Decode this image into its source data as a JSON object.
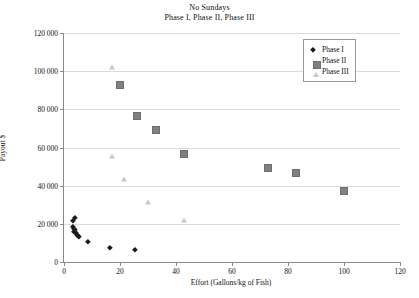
{
  "chart_data": {
    "type": "scatter",
    "title": "No Sundays",
    "subtitle": "Phase I, Phase II, Phase III",
    "xlabel": "Effort (Gallons/kg of Fish)",
    "ylabel": "Payout $",
    "xlim": [
      0,
      120
    ],
    "ylim": [
      0,
      120000
    ],
    "xticks": [
      "0",
      "20",
      "40",
      "60",
      "80",
      "100",
      "120"
    ],
    "xtick_values": [
      0,
      20,
      40,
      60,
      80,
      100,
      120
    ],
    "yticks": [
      "0",
      "20 000",
      "40 000",
      "60 000",
      "80 000",
      "100 000",
      "120 000"
    ],
    "ytick_values": [
      0,
      20000,
      40000,
      60000,
      80000,
      100000,
      120000
    ],
    "grid": "horizontal",
    "legend_position": "top-right",
    "series": [
      {
        "name": "Phase I",
        "marker": "diamond",
        "color": "#1b1b1b",
        "points": [
          [
            4.6,
            21800
          ],
          [
            4.0,
            20200
          ],
          [
            3.9,
            17200
          ],
          [
            4.3,
            16400
          ],
          [
            4.6,
            15600
          ],
          [
            4.4,
            14700
          ],
          [
            5.0,
            14200
          ],
          [
            5.2,
            13200
          ],
          [
            5.6,
            12800
          ],
          [
            6.2,
            12200
          ],
          [
            9.2,
            9200
          ],
          [
            17.0,
            6200
          ],
          [
            26.0,
            5000
          ]
        ]
      },
      {
        "name": "Phase II",
        "marker": "square",
        "color": "#808080",
        "points": [
          [
            20.0,
            93000
          ],
          [
            26.0,
            76500
          ],
          [
            33.0,
            69000
          ],
          [
            43.0,
            56500
          ],
          [
            73.0,
            49500
          ],
          [
            83.0,
            46500
          ],
          [
            100.0,
            37000
          ]
        ]
      },
      {
        "name": "Phase III",
        "marker": "triangle",
        "color": "#c9c9c9",
        "points": [
          [
            17.0,
            102000
          ],
          [
            17.0,
            55500
          ],
          [
            21.5,
            43500
          ],
          [
            30.0,
            31500
          ],
          [
            43.0,
            22000
          ]
        ]
      }
    ]
  },
  "legend": {
    "items": [
      {
        "label": "Phase I"
      },
      {
        "label": "Phase II"
      },
      {
        "label": "Phase III"
      }
    ]
  }
}
